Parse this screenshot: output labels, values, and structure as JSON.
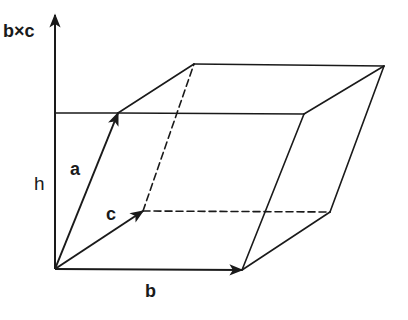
{
  "labels": {
    "axis": "b×c",
    "a": "a",
    "b": "b",
    "c": "c",
    "h": "h"
  },
  "vectors": [
    {
      "name": "a",
      "from": [
        55,
        269
      ],
      "to": [
        118,
        113
      ]
    },
    {
      "name": "b",
      "from": [
        55,
        269
      ],
      "to": [
        242,
        270
      ]
    },
    {
      "name": "c",
      "from": [
        55,
        269
      ],
      "to": [
        143,
        211
      ]
    },
    {
      "name": "b×c axis",
      "from": [
        55,
        269
      ],
      "to": [
        55,
        14
      ]
    }
  ],
  "colors": {
    "stroke": "#1a1a1a",
    "background": "#ffffff"
  }
}
